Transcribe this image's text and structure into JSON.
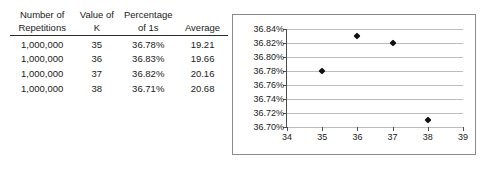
{
  "table": {
    "headers_top": [
      "Number of",
      "Value of",
      "Percentage",
      ""
    ],
    "headers_bottom": [
      "Repetitions",
      "K",
      "of 1s",
      "Average"
    ],
    "rows": [
      [
        "1,000,000",
        "35",
        "36.78%",
        "19.21"
      ],
      [
        "1,000,000",
        "36",
        "36.83%",
        "19.66"
      ],
      [
        "1,000,000",
        "37",
        "36.82%",
        "20.16"
      ],
      [
        "1,000,000",
        "38",
        "36.71%",
        "20.68"
      ]
    ]
  },
  "chart_data": {
    "type": "scatter",
    "title": "",
    "xlabel": "",
    "ylabel": "",
    "x": [
      35,
      36,
      37,
      38
    ],
    "values": [
      36.78,
      36.83,
      36.82,
      36.71
    ],
    "point_labels": [
      "36.78%",
      "36.83%",
      "36.82%",
      "36.71%"
    ],
    "xlim": [
      34,
      39
    ],
    "ylim": [
      36.7,
      36.84
    ],
    "xticks": [
      "34",
      "35",
      "36",
      "37",
      "38",
      "39"
    ],
    "xtick_values": [
      34,
      35,
      36,
      37,
      38,
      39
    ],
    "yticks": [
      "36.70%",
      "36.72%",
      "36.74%",
      "36.76%",
      "36.78%",
      "36.80%",
      "36.82%",
      "36.84%"
    ],
    "ytick_values": [
      36.7,
      36.72,
      36.74,
      36.76,
      36.78,
      36.8,
      36.82,
      36.84
    ],
    "grid": "horizontal",
    "legend": "none",
    "marker": "diamond",
    "marker_color": "#111111",
    "gridline_color": "#bdbdbd",
    "axis_color": "#4d4d4d",
    "border_color": "#8a8a8a"
  }
}
